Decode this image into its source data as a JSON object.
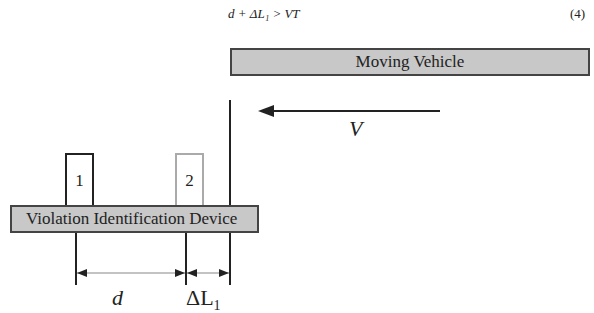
{
  "equation": {
    "text": "d + ΔL₁ > VT",
    "number": "(4)"
  },
  "diagram": {
    "moving_vehicle_label": "Moving Vehicle",
    "device_label": "Violation Identification Device",
    "sensors": [
      {
        "label": "1",
        "color": "#222222"
      },
      {
        "label": "2",
        "color": "#aaaaaa"
      }
    ],
    "velocity_label": "V",
    "distance_label": "d",
    "delta_label": "ΔL",
    "delta_subscript": "1"
  }
}
